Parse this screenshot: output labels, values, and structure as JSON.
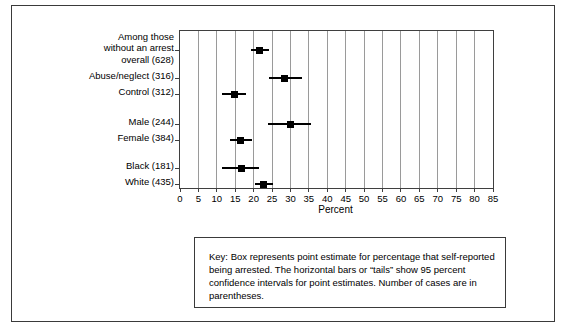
{
  "chart_data": {
    "type": "scatter",
    "title": "",
    "xlabel": "Percent",
    "ylabel": "",
    "xlim": [
      0,
      85
    ],
    "xticks": [
      0,
      5,
      10,
      15,
      20,
      25,
      30,
      35,
      40,
      45,
      50,
      55,
      60,
      65,
      70,
      75,
      80,
      85
    ],
    "grid": true,
    "legend_position": "below-plot",
    "categories": [
      "Among those without an arrest overall (628)",
      "Abuse/neglect (316)",
      "Control (312)",
      "Male (244)",
      "Female (384)",
      "Black (181)",
      "White (435)"
    ],
    "series": [
      {
        "name": "Point estimate (percent self-reported being arrested)",
        "values": [
          21.7,
          28.5,
          14.7,
          29.9,
          16.3,
          16.8,
          22.8
        ]
      },
      {
        "name": "95 percent confidence interval lower",
        "values": [
          19.3,
          24.2,
          11.5,
          24.0,
          13.5,
          11.5,
          20.3
        ]
      },
      {
        "name": "95 percent confidence interval upper",
        "values": [
          24.2,
          33.0,
          18.0,
          35.5,
          19.5,
          21.5,
          25.3
        ]
      }
    ],
    "rows": [
      {
        "label": "Among those\nwithout an arrest\noverall (628)",
        "label_lines": [
          "Among those",
          "without an arrest",
          "overall (628)"
        ],
        "n": 628,
        "estimate": 21.7,
        "ci_low": 19.3,
        "ci_high": 24.2
      },
      {
        "label": "Abuse/neglect (316)",
        "label_lines": [
          "Abuse/neglect (316)"
        ],
        "n": 316,
        "estimate": 28.5,
        "ci_low": 24.2,
        "ci_high": 33.0
      },
      {
        "label": "Control (312)",
        "label_lines": [
          "Control (312)"
        ],
        "n": 312,
        "estimate": 14.7,
        "ci_low": 11.5,
        "ci_high": 18.0
      },
      {
        "label": "Male (244)",
        "label_lines": [
          "Male (244)"
        ],
        "n": 244,
        "estimate": 29.9,
        "ci_low": 24.0,
        "ci_high": 35.5
      },
      {
        "label": "Female (384)",
        "label_lines": [
          "Female (384)"
        ],
        "n": 384,
        "estimate": 16.3,
        "ci_low": 13.5,
        "ci_high": 19.5
      },
      {
        "label": "Black (181)",
        "label_lines": [
          "Black (181)"
        ],
        "n": 181,
        "estimate": 16.8,
        "ci_low": 11.5,
        "ci_high": 21.5
      },
      {
        "label": "White (435)",
        "label_lines": [
          "White (435)"
        ],
        "n": 435,
        "estimate": 22.8,
        "ci_low": 20.3,
        "ci_high": 25.3
      }
    ]
  },
  "key": {
    "text": "Key: Box represents point estimate for percentage that self-reported being arrested. The horizontal bars or “tails” show 95 percent confidence intervals for point estimates. Number of cases are in parentheses."
  },
  "colors": {
    "marker": "#000000",
    "gridline": "#9a9a9a",
    "axis": "#3f3f3f",
    "frame": "#3a3a3a",
    "background": "#ffffff",
    "text": "#000000"
  }
}
